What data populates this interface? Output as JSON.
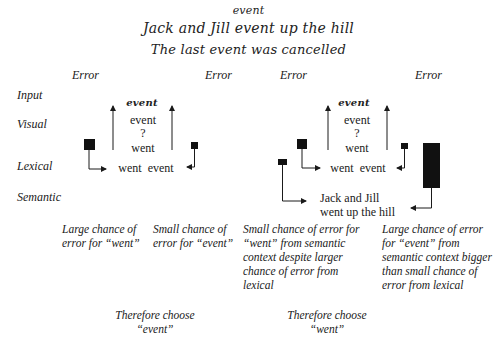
{
  "header": {
    "line1": "event",
    "line2": "Jack and Jill event up the hill",
    "line3": "The last event was cancelled"
  },
  "error_labels": [
    "Error",
    "Error",
    "Error",
    "Error"
  ],
  "row_labels": {
    "input": "Input",
    "visual": "Visual",
    "lexical": "Lexical",
    "semantic": "Semantic"
  },
  "left_diagram": {
    "input_word": "event",
    "visual_top": "event",
    "visual_q": "?",
    "visual_bottom": "went",
    "lexical": "went  event"
  },
  "right_diagram": {
    "input_word": "event",
    "visual_top": "event",
    "visual_q": "?",
    "visual_bottom": "went",
    "lexical": "went  event",
    "semantic_line1": "Jack and Jill",
    "semantic_line2": "went up the hill"
  },
  "captions": {
    "left_a": "Large chance of error for “went”",
    "left_b": "Small chance of error for “event”",
    "right_a": "Small chance of error for “went” from semantic context despite larger chance of error from lexical",
    "right_b": "Large chance of error for “event” from semantic context bigger than small chance of error from lexical"
  },
  "conclusions": {
    "left_line1": "Therefore choose",
    "left_line2": "“event”",
    "right_line1": "Therefore choose",
    "right_line2": "“went”"
  },
  "colors": {
    "ink": "#1a1a1a",
    "background": "#ffffff"
  }
}
